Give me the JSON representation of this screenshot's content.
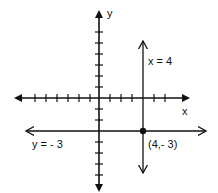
{
  "axes": {
    "x_label": "x",
    "y_label": "y",
    "tick_spacing_units": 1
  },
  "lines": {
    "vertical": {
      "label": "x = 4",
      "x": 4
    },
    "horizontal": {
      "label": "y = - 3",
      "y": -3
    }
  },
  "point": {
    "label": "(4,- 3)",
    "x": 4,
    "y": -3
  },
  "colors": {
    "ink": "#111111",
    "background": "#ffffff"
  }
}
